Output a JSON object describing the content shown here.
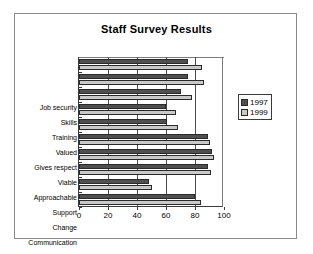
{
  "chart_data": {
    "type": "bar",
    "orientation": "horizontal",
    "title": "Staff Survey Results",
    "xlabel": "",
    "ylabel": "",
    "xlim": [
      0,
      100
    ],
    "xticks": [
      0,
      20,
      40,
      60,
      80,
      100
    ],
    "grid": true,
    "legend_position": "right",
    "categories": [
      "Job security",
      "Skills",
      "Training",
      "Valued",
      "Gives respect",
      "Viable",
      "Approachable",
      "Support",
      "Change",
      "Communication"
    ],
    "series": [
      {
        "name": "1997",
        "color": "#4f4f4f",
        "values": [
          75,
          75,
          70,
          60,
          61,
          89,
          92,
          89,
          48,
          80
        ]
      },
      {
        "name": "1999",
        "color": "#c9c9c9",
        "values": [
          85,
          86,
          78,
          67,
          68,
          90,
          93,
          91,
          50,
          84
        ]
      }
    ]
  },
  "legend": {
    "entries": [
      {
        "label": "1997"
      },
      {
        "label": "1999"
      }
    ]
  }
}
